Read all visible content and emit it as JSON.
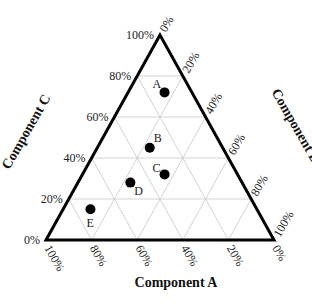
{
  "chart_data": {
    "type": "scatter",
    "subtype": "ternary",
    "title": "",
    "axes": {
      "A": {
        "label": "Component A",
        "ticks": [
          "100%",
          "80%",
          "60%",
          "40%",
          "20%",
          "0%"
        ]
      },
      "B": {
        "label": "Component B",
        "ticks": [
          "0%",
          "20%",
          "40%",
          "60%",
          "80%",
          "100%"
        ]
      },
      "C": {
        "label": "Component C",
        "ticks": [
          "0%",
          "20%",
          "40%",
          "60%",
          "80%",
          "100%"
        ]
      }
    },
    "grid": true,
    "grid_step": 0.2,
    "points": [
      {
        "label": "A",
        "A": 0.12,
        "B": 0.16,
        "C": 0.72
      },
      {
        "label": "B",
        "A": 0.32,
        "B": 0.23,
        "C": 0.45
      },
      {
        "label": "C",
        "A": 0.32,
        "B": 0.36,
        "C": 0.32
      },
      {
        "label": "D",
        "A": 0.49,
        "B": 0.23,
        "C": 0.28
      },
      {
        "label": "E",
        "A": 0.73,
        "B": 0.12,
        "C": 0.15
      }
    ]
  },
  "colors": {
    "frame": "#000000",
    "grid": "#c8c8c8",
    "point": "#000000"
  }
}
